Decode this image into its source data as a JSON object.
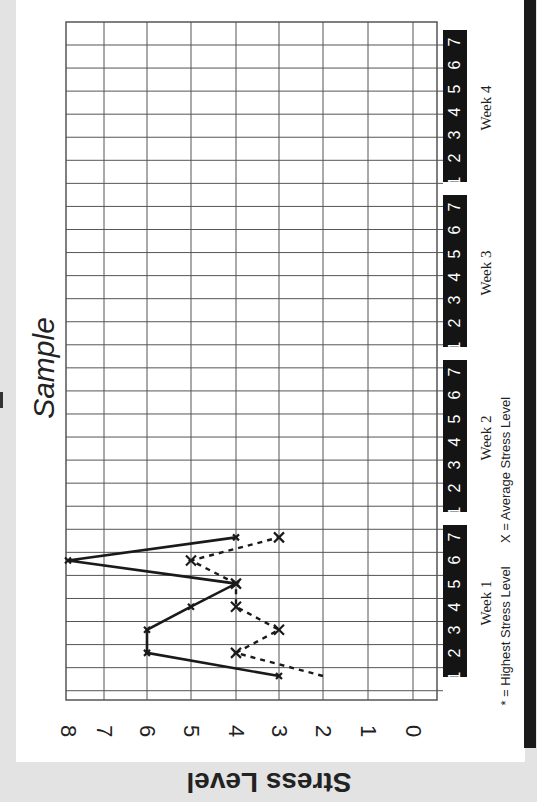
{
  "chart_data": {
    "type": "line",
    "title": "Sample",
    "ylabel": "Stress Level",
    "xlabel": "Day of week",
    "ylim": [
      0,
      8
    ],
    "y_ticks": [
      "8",
      "7",
      "6",
      "5",
      "4",
      "3",
      "2",
      "1",
      "0"
    ],
    "grid": true,
    "orientation": "rotated 90° (days run bottom-to-top, stress values left-to-right)",
    "weeks": [
      {
        "label": "Week 1",
        "days": [
          "1",
          "2",
          "3",
          "4",
          "5",
          "6",
          "7"
        ]
      },
      {
        "label": "Week 2",
        "days": [
          "1",
          "2",
          "3",
          "4",
          "5",
          "6",
          "7"
        ]
      },
      {
        "label": "Week 3",
        "days": [
          "1",
          "2",
          "3",
          "4",
          "5",
          "6",
          "7"
        ]
      },
      {
        "label": "Week 4",
        "days": [
          "1",
          "2",
          "3",
          "4",
          "5",
          "6",
          "7"
        ]
      }
    ],
    "categories": [
      "W1 D1",
      "W1 D2",
      "W1 D3",
      "W1 D4",
      "W1 D5",
      "W1 D6",
      "W1 D7"
    ],
    "series": [
      {
        "name": "Highest Stress Level",
        "marker": "*",
        "style": "solid",
        "values": [
          3,
          6,
          6,
          5,
          4,
          8,
          4
        ]
      },
      {
        "name": "Average Stress Level",
        "marker": "X",
        "style": "dashed",
        "values": [
          2,
          4,
          3,
          4,
          4,
          5,
          3
        ]
      }
    ],
    "legend": [
      "* = Highest Stress Level",
      "X = Average Stress Level"
    ]
  },
  "title": "Sample",
  "y_axis_label": "Stress Level",
  "ticks": [
    "8",
    "7",
    "6",
    "5",
    "4",
    "3",
    "2",
    "1",
    "0"
  ],
  "weeks": [
    "Week 1",
    "Week 2",
    "Week 3",
    "Week 4"
  ],
  "days": [
    "1",
    "2",
    "3",
    "4",
    "5",
    "6",
    "7"
  ],
  "legend": {
    "highest": "* = Highest Stress Level",
    "average": "X = Average Stress Level"
  },
  "colors": {
    "ink": "#1a1a1a",
    "grid": "#555555",
    "page": "#ffffff",
    "background": "#e3e3e3"
  }
}
